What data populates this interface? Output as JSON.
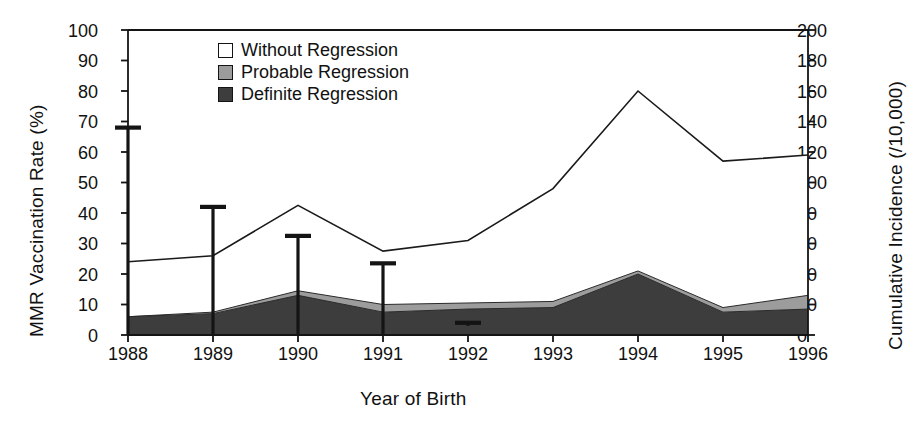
{
  "chart_data": {
    "type": "area",
    "title": "",
    "xlabel": "Year of Birth",
    "ylabel": "MMR Vaccination Rate (%)",
    "y2label": "Cumulative Incidence (/10,000)",
    "categories": [
      "1988",
      "1989",
      "1990",
      "1991",
      "1992",
      "1993",
      "1994",
      "1995",
      "1996"
    ],
    "x": [
      1988,
      1989,
      1990,
      1991,
      1992,
      1993,
      1994,
      1995,
      1996
    ],
    "ylim": [
      0,
      100
    ],
    "yticks": [
      0,
      10,
      20,
      30,
      40,
      50,
      60,
      70,
      80,
      90,
      100
    ],
    "y2lim": [
      0,
      200
    ],
    "y2ticks": [
      0,
      20,
      40,
      60,
      80,
      100,
      120,
      140,
      160,
      180,
      200
    ],
    "grid": false,
    "legend_position": "top-left",
    "legend": [
      "Without Regression",
      "Probable Regression",
      "Definite Regression"
    ],
    "stacking": "cumulative",
    "series": [
      {
        "name": "Definite Regression",
        "axis": "right",
        "unit": "/10,000",
        "color": "#3d3d3d",
        "values": [
          12,
          14,
          26,
          15,
          17,
          18,
          40,
          15,
          17
        ]
      },
      {
        "name": "Probable Regression",
        "axis": "right",
        "unit": "/10,000",
        "color": "#9c9c9c",
        "values": [
          0,
          1,
          3,
          5,
          4,
          4,
          2,
          3,
          9
        ]
      },
      {
        "name": "Without Regression",
        "axis": "right",
        "unit": "/10,000",
        "color": "#ffffff",
        "values": [
          36,
          37,
          56,
          35,
          41,
          74,
          118,
          96,
          92
        ]
      }
    ],
    "cumulative_totals_right_axis": [
      48,
      52,
      85,
      55,
      62,
      96,
      160,
      114,
      118
    ],
    "cumulative_line_top_values": [
      48,
      52,
      85,
      55,
      62,
      96,
      160,
      114,
      118
    ],
    "band_tops_right_axis": {
      "definite": [
        12,
        14,
        26,
        15,
        17,
        18,
        40,
        15,
        17
      ],
      "probable": [
        12,
        15,
        29,
        20,
        21,
        22,
        42,
        18,
        26
      ]
    },
    "vaccination_rate_errorbars": {
      "name": "MMR Vaccination Rate (%)",
      "axis": "left",
      "unit": "%",
      "years": [
        1988,
        1989,
        1990,
        1991,
        1992
      ],
      "upper": [
        68,
        42,
        32.5,
        23.5,
        4
      ],
      "lower": [
        0,
        0,
        0,
        0,
        3
      ]
    }
  },
  "axes": {
    "left_title": "MMR Vaccination Rate (%)",
    "right_title": "Cumulative Incidence (/10,000)",
    "x_title": "Year of Birth",
    "left_ticks": [
      "100",
      "90",
      "80",
      "70",
      "60",
      "50",
      "40",
      "30",
      "20",
      "10",
      "0"
    ],
    "right_ticks": [
      "200",
      "180",
      "160",
      "140",
      "120",
      "100",
      "80",
      "60",
      "40",
      "20",
      "0"
    ],
    "x_ticks": [
      "1988",
      "1989",
      "1990",
      "1991",
      "1992",
      "1993",
      "1994",
      "1995",
      "1996"
    ]
  },
  "legend": {
    "items": [
      {
        "label": "Without Regression",
        "color": "#ffffff"
      },
      {
        "label": "Probable Regression",
        "color": "#9c9c9c"
      },
      {
        "label": "Definite Regression",
        "color": "#3d3d3d"
      }
    ]
  },
  "colors": {
    "axis": "#141414",
    "white_band": "#ffffff",
    "mid_band": "#9c9c9c",
    "dark_band": "#3d3d3d",
    "line": "#1a1a1a",
    "errorbar": "#141414"
  }
}
